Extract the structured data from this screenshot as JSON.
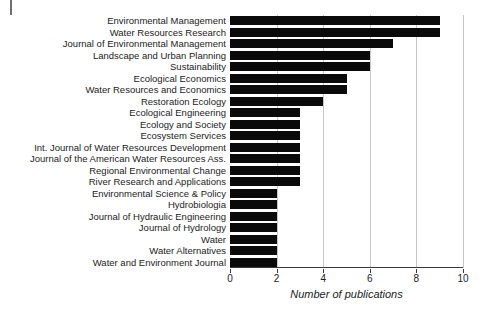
{
  "figure": {
    "corner_mark": "page-edge-tick"
  },
  "chart_data": {
    "type": "bar",
    "orientation": "horizontal",
    "title": "",
    "xlabel": "Number of publications",
    "ylabel": "",
    "xlim": [
      0,
      10
    ],
    "xticks": [
      0,
      2,
      4,
      6,
      8,
      10
    ],
    "xtick_labels": [
      "0",
      "2",
      "4",
      "6",
      "8",
      "10"
    ],
    "grid": "vertical",
    "legend": "none",
    "bar_color": "#0a0a0a",
    "categories": [
      "Environmental Management",
      "Water Resources Research",
      "Journal of Environmental Management",
      "Landscape and Urban Planning",
      "Sustainability",
      "Ecological Economics",
      "Water Resources and Economics",
      "Restoration Ecology",
      "Ecological Engineering",
      "Ecology and Society",
      "Ecosystem Services",
      "Int. Journal of Water Resources Development",
      "Journal of the American Water Resources Ass.",
      "Regional Environmental Change",
      "River Research and Applications",
      "Environmental Science & Policy",
      "Hydrobiologia",
      "Journal of Hydraulic Engineering",
      "Journal of Hydrology",
      "Water",
      "Water Alternatives",
      "Water and Environment Journal"
    ],
    "values": [
      9,
      9,
      7,
      6,
      6,
      5,
      5,
      4,
      3,
      3,
      3,
      3,
      3,
      3,
      3,
      2,
      2,
      2,
      2,
      2,
      2,
      2
    ]
  }
}
